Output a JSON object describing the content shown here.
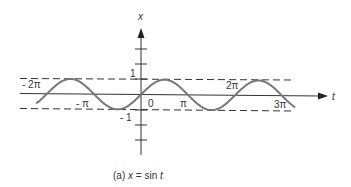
{
  "chart_data": {
    "type": "line",
    "title": "(a) x = sin t",
    "caption": {
      "prefix": "(a)",
      "var": "x",
      "eq": "=",
      "fn": "sin",
      "arg": "t"
    },
    "xlabel": "t",
    "ylabel": "x",
    "function": "sin(t)",
    "x_range": [
      -7.0,
      10.3
    ],
    "ylim": [
      -1,
      1
    ],
    "x_tick_labels": [
      "- 2π",
      "- π",
      "0",
      "π",
      "2π",
      "3π"
    ],
    "x_tick_values": [
      -6.2832,
      -3.1416,
      0,
      3.1416,
      6.2832,
      9.4248
    ],
    "y_tick_labels": [
      "1",
      "- 1"
    ],
    "y_tick_values": [
      1,
      -1
    ],
    "reference_lines": [
      {
        "y": 1,
        "style": "dashed"
      },
      {
        "y": -1,
        "style": "dashed"
      }
    ],
    "grid": false,
    "legend": null
  },
  "colors": {
    "curve": "#777777",
    "axis": "#333333",
    "dash": "#333333",
    "text": "#333333"
  }
}
